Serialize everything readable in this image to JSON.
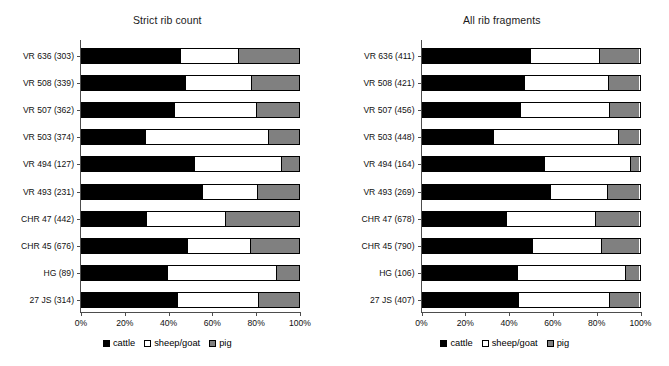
{
  "chart_data": [
    {
      "type": "bar",
      "title": "Strict rib count",
      "orientation": "horizontal",
      "stacked": true,
      "normalized": true,
      "xlabel": "",
      "ylabel": "",
      "xlim": [
        0,
        100
      ],
      "grid": false,
      "xticks": [
        "0%",
        "20%",
        "40%",
        "60%",
        "80%",
        "100%"
      ],
      "xtick_values": [
        0,
        20,
        40,
        60,
        80,
        100
      ],
      "legend": [
        "cattle",
        "sheep/goat",
        "pig"
      ],
      "legend_position": "bottom-center",
      "categories": [
        "VR 636 (303)",
        "VR 508 (339)",
        "VR 507 (362)",
        "VR 503 (374)",
        "VR 494 (127)",
        "VR 493 (231)",
        "CHR 47 (442)",
        "CHR 45 (676)",
        "HG (89)",
        "27 JS (314)"
      ],
      "series": [
        {
          "name": "cattle",
          "values": [
            45.5,
            48.0,
            43.0,
            29.5,
            52.0,
            55.8,
            30.0,
            49.0,
            39.7,
            44.4
          ]
        },
        {
          "name": "sheep/goat",
          "values": [
            26.9,
            30.5,
            37.7,
            56.5,
            40.0,
            25.2,
            36.2,
            28.7,
            50.3,
            37.0
          ]
        },
        {
          "name": "pig",
          "values": [
            27.6,
            21.5,
            19.3,
            14.0,
            8.0,
            19.0,
            33.8,
            22.3,
            10.0,
            18.6
          ]
        }
      ]
    },
    {
      "type": "bar",
      "title": "All rib fragments",
      "orientation": "horizontal",
      "stacked": true,
      "normalized": true,
      "xlabel": "",
      "ylabel": "",
      "xlim": [
        0,
        100
      ],
      "grid": false,
      "xticks": [
        "0%",
        "20%",
        "40%",
        "60%",
        "80%",
        "100%"
      ],
      "xtick_values": [
        0,
        20,
        40,
        60,
        80,
        100
      ],
      "legend": [
        "cattle",
        "sheep/goat",
        "pig"
      ],
      "legend_position": "bottom-center",
      "categories": [
        "VR 636 (411)",
        "VR 508 (421)",
        "VR 507 (456)",
        "VR 503 (448)",
        "VR 494 (164)",
        "VR 493 (269)",
        "CHR 47 (678)",
        "CHR 45 (790)",
        "HG (106)",
        "27 JS (407)"
      ],
      "series": [
        {
          "name": "cattle",
          "values": [
            50.0,
            47.4,
            45.5,
            33.0,
            56.5,
            59.0,
            39.0,
            51.0,
            44.0,
            44.7
          ]
        },
        {
          "name": "sheep/goat",
          "values": [
            32.0,
            38.6,
            40.9,
            57.5,
            39.5,
            26.6,
            41.0,
            31.5,
            49.6,
            41.7
          ]
        },
        {
          "name": "pig",
          "values": [
            18.0,
            14.0,
            13.6,
            9.5,
            4.0,
            14.4,
            20.0,
            17.5,
            6.4,
            13.6
          ]
        }
      ]
    }
  ],
  "colors": {
    "cattle": "#000000",
    "sheep_goat": "#ffffff",
    "pig": "#808080",
    "axis": "#4d4d4d",
    "background": "#ffffff"
  }
}
